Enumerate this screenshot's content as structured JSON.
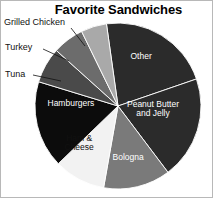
{
  "figure": {
    "width": 213,
    "height": 198,
    "background": "#ffffff",
    "border_color": "#b8b8b8"
  },
  "title": "Favorite Sandwiches",
  "chart_data": {
    "type": "pie",
    "title": "Favorite Sandwiches",
    "xlabel": "",
    "ylabel": "",
    "legend_position": "none",
    "grid": false,
    "center": {
      "x": 117,
      "y": 105
    },
    "radius": 83,
    "start_angle_deg": -98,
    "direction": "clockwise",
    "categories": [
      "Other",
      "Peanut Butter and Jelly",
      "Bologna",
      "Ham & Cheese",
      "Hamburgers",
      "Tuna",
      "Turkey",
      "Grilled Chicken"
    ],
    "values": [
      22,
      20,
      13,
      10,
      17,
      7,
      6,
      5
    ],
    "slices": [
      {
        "label": "Other",
        "value": 22,
        "color": "#2b2b2b",
        "text_color": "#ffffff",
        "label_placement": "inside",
        "label_x": 140,
        "label_y": 56,
        "start_deg": -98,
        "end_deg": -19
      },
      {
        "label": "Peanut Butter\nand Jelly",
        "value": 20,
        "color": "#2b2b2b",
        "text_color": "#ffffff",
        "label_placement": "inside",
        "label_x": 152,
        "label_y": 108,
        "start_deg": -19,
        "end_deg": 53
      },
      {
        "label": "Bologna",
        "value": 13,
        "color": "#7a7a7a",
        "text_color": "#ffffff",
        "label_placement": "inside",
        "label_x": 127,
        "label_y": 157,
        "start_deg": 53,
        "end_deg": 100
      },
      {
        "label": "Ham &\nCheese",
        "value": 10,
        "color": "#f2f2f2",
        "text_color": "#111111",
        "label_placement": "inside",
        "label_x": 78,
        "label_y": 142,
        "start_deg": 100,
        "end_deg": 136
      },
      {
        "label": "Hamburgers",
        "value": 17,
        "color": "#0c0c0c",
        "text_color": "#ffffff",
        "label_placement": "inside",
        "label_x": 70,
        "label_y": 103,
        "start_deg": 136,
        "end_deg": 197
      },
      {
        "label": "Tuna",
        "value": 7,
        "color": "#4a4a4a",
        "text_color": "#111111",
        "label_placement": "callout",
        "label_x": 4,
        "label_y": 68,
        "start_deg": 197,
        "end_deg": 222
      },
      {
        "label": "Turkey",
        "value": 6,
        "color": "#6c6c6c",
        "text_color": "#111111",
        "label_placement": "callout",
        "label_x": 4,
        "label_y": 41,
        "start_deg": 222,
        "end_deg": 244
      },
      {
        "label": "Grilled Chicken",
        "value": 5,
        "color": "#a9a9a9",
        "text_color": "#111111",
        "label_placement": "callout",
        "label_x": 3,
        "label_y": 16,
        "start_deg": 244,
        "end_deg": 262
      }
    ],
    "callouts": [
      {
        "label": "Grilled Chicken",
        "line": {
          "x1": 70,
          "y1": 27,
          "x2": 84,
          "y2": 45
        }
      },
      {
        "label": "Turkey",
        "line": {
          "x1": 42,
          "y1": 48,
          "x2": 68,
          "y2": 60
        }
      },
      {
        "label": "Tuna",
        "line": {
          "x1": 32,
          "y1": 74,
          "x2": 60,
          "y2": 80
        }
      }
    ]
  }
}
